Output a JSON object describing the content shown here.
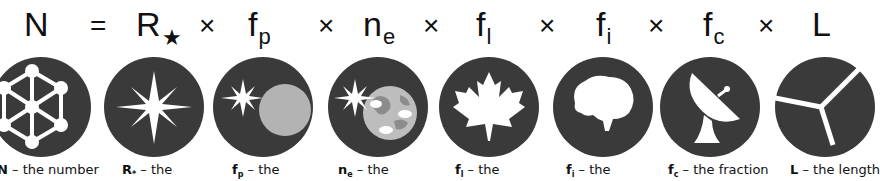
{
  "equation": {
    "lhs": "N",
    "equals": "=",
    "times": "×",
    "terms": [
      {
        "base": "R",
        "sub": "★"
      },
      {
        "base": "f",
        "sub": "p"
      },
      {
        "base": "n",
        "sub": "e"
      },
      {
        "base": "f",
        "sub": "l"
      },
      {
        "base": "f",
        "sub": "i"
      },
      {
        "base": "f",
        "sub": "c"
      },
      {
        "base": "L",
        "sub": ""
      }
    ]
  },
  "icons": [
    {
      "name": "network-icon"
    },
    {
      "name": "star-icon"
    },
    {
      "name": "star-planet-icon"
    },
    {
      "name": "star-earth-icon"
    },
    {
      "name": "maple-leaf-icon"
    },
    {
      "name": "brain-icon"
    },
    {
      "name": "radio-dish-icon"
    },
    {
      "name": "clock-icon"
    }
  ],
  "labels": [
    {
      "sym": "N",
      "sub": "",
      "text": " – the number"
    },
    {
      "sym": "R",
      "sub": "*",
      "text": " – the"
    },
    {
      "sym": "f",
      "sub": "p",
      "text": " – the"
    },
    {
      "sym": "n",
      "sub": "e",
      "text": " – the"
    },
    {
      "sym": "f",
      "sub": "l",
      "text": " – the"
    },
    {
      "sym": "f",
      "sub": "i",
      "text": " – the"
    },
    {
      "sym": "f",
      "sub": "c",
      "text": " – the fraction"
    },
    {
      "sym": "L",
      "sub": "",
      "text": " – the length"
    }
  ],
  "colors": {
    "circle": "#3a3a3a",
    "symbol": "#ffffff",
    "planet": "#b3b3b3",
    "earth_land": "#8c8c8c"
  }
}
